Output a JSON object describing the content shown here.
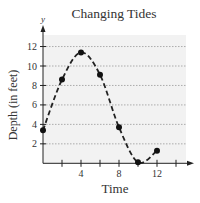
{
  "chart_data": {
    "type": "scatter",
    "title": "Changing Tides",
    "xlabel": "Time",
    "ylabel": "Depth (in feet)",
    "y_axis_letter": "y",
    "x": [
      0,
      2,
      4,
      6,
      8,
      10,
      12
    ],
    "series": [
      {
        "name": "Tide depth",
        "values": [
          3.4,
          8.6,
          11.4,
          9.1,
          3.7,
          0.1,
          1.3
        ],
        "marker": "circle",
        "line": "dashed smooth curve"
      }
    ],
    "x_ticks": [
      2,
      4,
      6,
      8,
      10,
      12,
      14
    ],
    "x_tick_labels": [
      "4",
      "8",
      "12"
    ],
    "x_tick_label_values": [
      4,
      8,
      12
    ],
    "y_ticks": [
      2,
      4,
      6,
      8,
      10,
      12
    ],
    "y_tick_labels": [
      "2",
      "4",
      "6",
      "8",
      "10",
      "12"
    ],
    "xlim": [
      0,
      15.5
    ],
    "ylim": [
      0,
      13
    ],
    "grid": "horizontal dotted",
    "background": "#f2f2f2",
    "colors": {
      "curve": "#222222",
      "points": "#111111",
      "grid": "#9a9a9a",
      "axis": "#222222"
    }
  }
}
